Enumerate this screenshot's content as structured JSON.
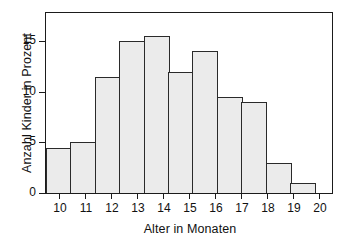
{
  "chart_data": {
    "type": "bar",
    "title": "",
    "subtitle": "",
    "xlabel": "Alter in Monaten",
    "ylabel": "Anzahl Kinder in Prozent",
    "categories": [
      "10",
      "11",
      "12",
      "13",
      "14",
      "15",
      "16",
      "17",
      "18",
      "19",
      "20"
    ],
    "values": [
      4.5,
      5,
      11.5,
      15,
      15.5,
      12,
      14,
      9.5,
      9,
      3,
      1
    ],
    "series": [
      {
        "name": "Anzahl Kinder in Prozent",
        "values": [
          4.5,
          5,
          11.5,
          15,
          15.5,
          12,
          14,
          9.5,
          9,
          3,
          1
        ]
      }
    ],
    "ylim": [
      0,
      17.8
    ],
    "xlim": [
      9.5,
      20.5
    ],
    "yticks": [
      0,
      5,
      10,
      15
    ],
    "ytick_labels": [
      "0",
      "5",
      "10",
      "15"
    ],
    "xtick_labels": [
      "10",
      "11",
      "12",
      "13",
      "14",
      "15",
      "16",
      "17",
      "18",
      "19",
      "20"
    ],
    "grid": false,
    "legend": false,
    "legend_position": "none",
    "bar_fill_color": "#ebebeb",
    "bar_edge_color": "#2a2a2a",
    "frame_color": "#1b1b1b",
    "background_color": "#ffffff",
    "annotations": []
  }
}
